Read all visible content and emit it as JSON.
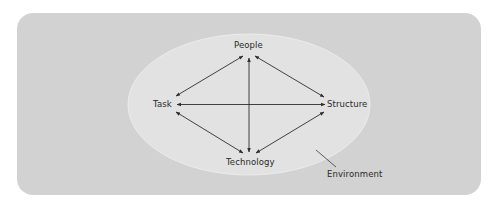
{
  "diagram": {
    "colors": {
      "page_background": "#ffffff",
      "frame_fill": "#d2d2d2",
      "ellipse_fill": "#e2e2e2",
      "ellipse_stroke": "#ececec",
      "line": "#2e2e2e",
      "text": "#2a2a2a"
    },
    "nodes": {
      "people": "People",
      "task": "Task",
      "structure": "Structure",
      "technology": "Technology"
    },
    "environment_label": "Environment",
    "edges": [
      {
        "from": "People",
        "to": "Task",
        "bidirectional": true
      },
      {
        "from": "People",
        "to": "Structure",
        "bidirectional": true
      },
      {
        "from": "People",
        "to": "Technology",
        "bidirectional": true
      },
      {
        "from": "Task",
        "to": "Structure",
        "bidirectional": true
      },
      {
        "from": "Task",
        "to": "Technology",
        "bidirectional": true
      },
      {
        "from": "Structure",
        "to": "Technology",
        "bidirectional": true
      }
    ]
  }
}
